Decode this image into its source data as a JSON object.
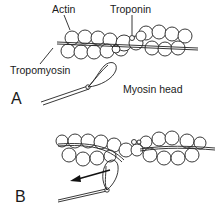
{
  "figure": {
    "type": "muscle contraction schematic",
    "labels": {
      "actin": "Actin",
      "troponin": "Troponin",
      "tropomyosin": "Tropomyosin",
      "myosin_head": "Myosin head"
    },
    "panels": [
      {
        "id": "A",
        "label": "A",
        "description": "Myosin head detached from actin filament"
      },
      {
        "id": "B",
        "label": "B",
        "description": "Myosin head bound to actin; arrow shows power stroke direction"
      }
    ],
    "colors": {
      "line": "#222222",
      "background": "#ffffff"
    }
  }
}
